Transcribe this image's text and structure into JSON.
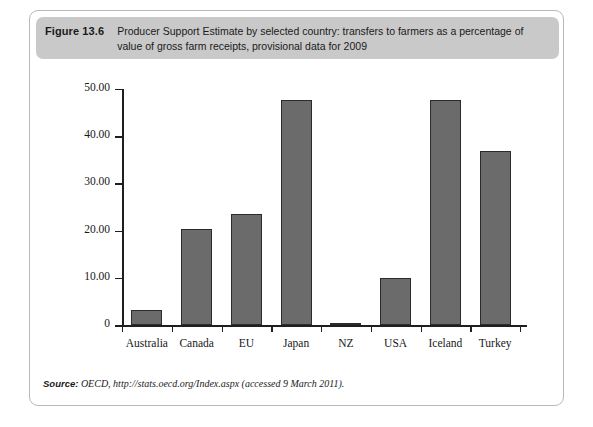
{
  "figure": {
    "number": "Figure 13.6",
    "caption": "Producer Support Estimate by selected country: transfers to farmers as a percentage of value of gross farm receipts, provisional data for 2009",
    "source_label": "Source:",
    "source_text": "OECD, http://stats.oecd.org/Index.aspx (accessed 9 March 2011).",
    "header_bg": "#c9c9c9",
    "bar_fill": "#6b6b6b",
    "bar_stroke": "#2b2b2b",
    "card_border": "#b9b9b9"
  },
  "chart_data": {
    "type": "bar",
    "title": "Producer Support Estimate by selected country: transfers to farmers as a percentage of value of gross farm receipts, provisional data for 2009",
    "xlabel": "",
    "ylabel": "",
    "categories": [
      "Australia",
      "Canada",
      "EU",
      "Japan",
      "NZ",
      "USA",
      "Iceland",
      "Turkey"
    ],
    "values": [
      3.2,
      20.4,
      23.5,
      47.7,
      0.5,
      10.0,
      47.7,
      36.8
    ],
    "ylim": [
      0,
      50
    ],
    "ytick_values": [
      0,
      10,
      20,
      30,
      40,
      50
    ],
    "ytick_labels": [
      "0",
      "10.00",
      "20.00",
      "30.00",
      "40.00",
      "50.00"
    ],
    "grid": false,
    "legend": false
  }
}
